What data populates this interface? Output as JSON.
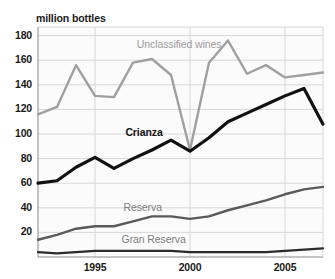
{
  "chart_data": {
    "type": "line",
    "title": "",
    "subtitle": "",
    "xlabel": "",
    "ylabel": "million bottles",
    "ylim": [
      0,
      190
    ],
    "xlim": [
      1992,
      2007
    ],
    "grid": true,
    "legend_position": "inline-labels",
    "x": [
      1992,
      1993,
      1994,
      1995,
      1996,
      1997,
      1998,
      1999,
      2000,
      2001,
      2002,
      2003,
      2004,
      2005,
      2006,
      2007
    ],
    "ytick_labels": [
      "180",
      "160",
      "140",
      "120",
      "100",
      "80",
      "60",
      "40",
      "20"
    ],
    "ytick_values": [
      180,
      160,
      140,
      120,
      100,
      80,
      60,
      40,
      20
    ],
    "xtick_labels": [
      "1995",
      "2000",
      "2005"
    ],
    "xtick_values": [
      1995,
      2000,
      2005
    ],
    "series": [
      {
        "name": "Unclassified wines",
        "color": "#a0a0a0",
        "values": [
          116,
          122,
          156,
          131,
          130,
          158,
          161,
          148,
          87,
          158,
          176,
          149,
          156,
          146,
          148,
          150
        ]
      },
      {
        "name": "Crianza",
        "color": "#111111",
        "values": [
          60,
          62,
          73,
          81,
          72,
          80,
          87,
          95,
          86,
          97,
          110,
          117,
          124,
          131,
          137,
          108
        ]
      },
      {
        "name": "Reserva",
        "color": "#5a5a5a",
        "values": [
          14,
          18,
          23,
          25,
          25,
          29,
          33,
          33,
          31,
          33,
          38,
          42,
          46,
          51,
          55,
          57
        ]
      },
      {
        "name": "Gran Reserva",
        "color": "#2b2b2b",
        "values": [
          4,
          3,
          4,
          5,
          5,
          5,
          5,
          5,
          4,
          4,
          4,
          4,
          4,
          5,
          6,
          7
        ]
      }
    ],
    "annotations": [
      {
        "text": "Unclassified wines",
        "x": 1997.2,
        "y": 172,
        "series": "Unclassified wines"
      },
      {
        "text": "Crianza",
        "x": 1996.6,
        "y": 101,
        "series": "Crianza"
      },
      {
        "text": "Reserva",
        "x": 1996.5,
        "y": 40,
        "series": "Reserva"
      },
      {
        "text": "Gran Reserva",
        "x": 1996.4,
        "y": 14,
        "series": "Gran Reserva"
      }
    ],
    "colors": {
      "grid": "#d8d8d8",
      "axis": "#8a8a8a",
      "plot_background": "#fbfbfb",
      "text": "#1a1a1a"
    }
  }
}
